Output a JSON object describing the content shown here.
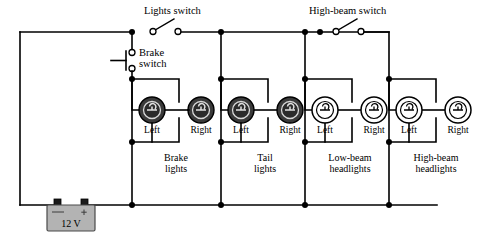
{
  "figure": {
    "background_color": "#ffffff",
    "wire_color": "#000000"
  },
  "switches": [
    {
      "id": "lights-switch",
      "label": "Lights switch",
      "type": "single-pole-open",
      "state": "open"
    },
    {
      "id": "brake-switch",
      "label_line1": "Brake",
      "label_line2": "switch",
      "type": "push-button",
      "state": "open"
    },
    {
      "id": "high-beam-switch",
      "label": "High-beam switch",
      "type": "single-pole-open",
      "state": "open"
    }
  ],
  "lamp_groups": [
    {
      "id": "brake-lights",
      "name_line1": "Brake",
      "name_line2": "lights",
      "style": "filled",
      "lamps": [
        {
          "side": "Left"
        },
        {
          "side": "Right"
        }
      ]
    },
    {
      "id": "tail-lights",
      "name_line1": "Tail",
      "name_line2": "lights",
      "style": "filled",
      "lamps": [
        {
          "side": "Left"
        },
        {
          "side": "Right"
        }
      ]
    },
    {
      "id": "low-beam-headlights",
      "name_line1": "Low-beam",
      "name_line2": "headlights",
      "style": "open",
      "lamps": [
        {
          "side": "Left"
        },
        {
          "side": "Right"
        }
      ]
    },
    {
      "id": "high-beam-headlights",
      "name_line1": "High-beam",
      "name_line2": "headlights",
      "style": "open",
      "lamps": [
        {
          "side": "Left"
        },
        {
          "side": "Right"
        }
      ]
    }
  ],
  "battery": {
    "id": "battery-12v",
    "label": "12 V",
    "negative_sign": "–",
    "positive_sign": "+",
    "body_color": "#b3b3b3"
  }
}
